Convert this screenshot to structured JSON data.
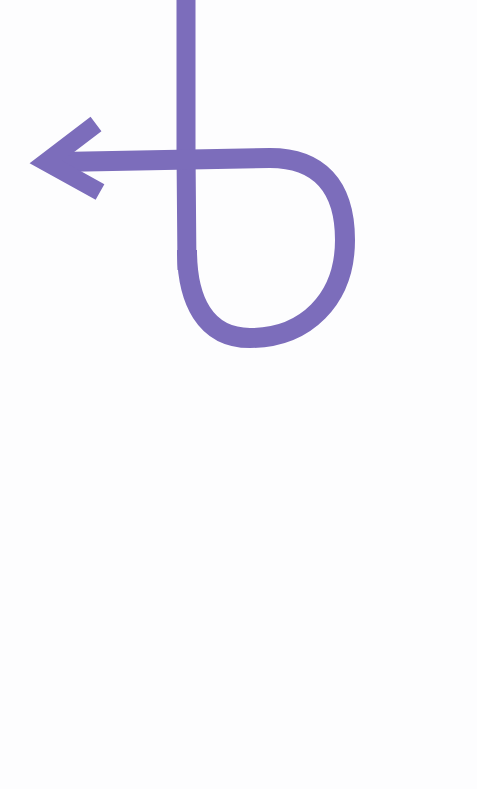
{
  "illustration": {
    "description": "Brush-stroke arrow: vertical line descending from top, looping right and back, crossing itself and pointing left",
    "stroke_color": "#7c6dbb",
    "background_color": "#fdfdfe",
    "stroke_width": 20,
    "direction": "left",
    "icon": "loop-arrow-left-icon"
  }
}
